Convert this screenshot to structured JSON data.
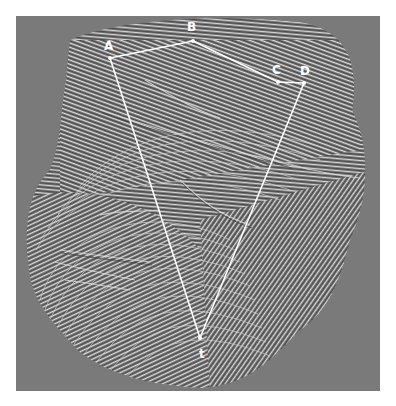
{
  "figure": {
    "panel": {
      "x": 16,
      "y": 16,
      "width": 364,
      "height": 375,
      "background": "#7a7a7a"
    },
    "ridge_colors": {
      "light": "#e6e6e6",
      "dark": "#4a4a4a"
    },
    "annotation_color": "#ffffff",
    "points": [
      {
        "id": "A",
        "label": "A",
        "x": 110,
        "y": 58,
        "lx": 104,
        "ly": 50
      },
      {
        "id": "B",
        "label": "B",
        "x": 193,
        "y": 41,
        "lx": 187,
        "ly": 31
      },
      {
        "id": "C",
        "label": "C",
        "x": 278,
        "y": 82,
        "lx": 272,
        "ly": 74
      },
      {
        "id": "D",
        "label": "D",
        "x": 304,
        "y": 83,
        "lx": 300,
        "ly": 75
      },
      {
        "id": "t",
        "label": "t",
        "x": 200,
        "y": 338,
        "lx": 199,
        "ly": 358
      }
    ],
    "polygon_order": [
      "A",
      "B",
      "C",
      "D",
      "t",
      "A"
    ]
  }
}
